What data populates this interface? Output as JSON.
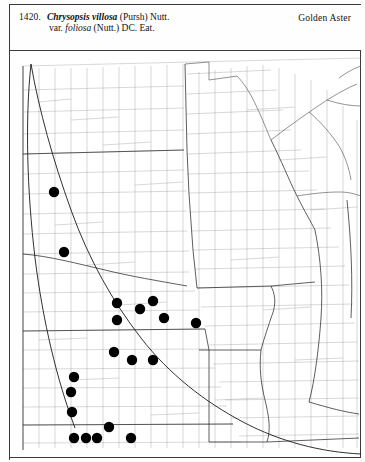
{
  "plate": {
    "number": "1420.",
    "scientific_name_line1_italic": "Chrysopsis villosa",
    "scientific_name_line1_rest": "(Pursh) Nutt.",
    "scientific_name_line2_prefix": "var.",
    "scientific_name_line2_italic": "foliosa",
    "scientific_name_line2_rest": "(Nutt.) DC. Eat.",
    "common_name": "Golden Aster"
  },
  "map": {
    "type": "county-distribution-dot-map",
    "region": "North Central United States",
    "colors": {
      "county_line": "#8f8f8f",
      "state_line": "#2a2a2a",
      "range_line": "#1a1a1a",
      "dot_fill": "#000000",
      "background": "#ffffff"
    },
    "dot_radius_px": 5.2,
    "dot_count": 19,
    "occurrence_dots": [
      {
        "x": 45,
        "y": 142
      },
      {
        "x": 55,
        "y": 202
      },
      {
        "x": 108,
        "y": 253
      },
      {
        "x": 108,
        "y": 270
      },
      {
        "x": 144,
        "y": 251
      },
      {
        "x": 155,
        "y": 268
      },
      {
        "x": 187,
        "y": 273
      },
      {
        "x": 131,
        "y": 259
      },
      {
        "x": 105,
        "y": 302
      },
      {
        "x": 123,
        "y": 310
      },
      {
        "x": 144,
        "y": 310
      },
      {
        "x": 65,
        "y": 327
      },
      {
        "x": 62,
        "y": 342
      },
      {
        "x": 63,
        "y": 362
      },
      {
        "x": 100,
        "y": 377
      },
      {
        "x": 65,
        "y": 388
      },
      {
        "x": 77,
        "y": 388
      },
      {
        "x": 88,
        "y": 388
      },
      {
        "x": 122,
        "y": 388
      }
    ],
    "range_boundary_label": "range-outline"
  }
}
